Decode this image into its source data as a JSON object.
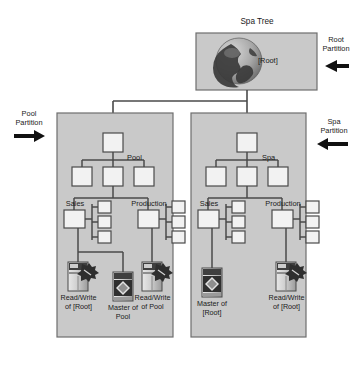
{
  "diagram": {
    "title": "Spa Tree",
    "background_color": "#ffffff",
    "partition_fill": "#c9c9c9",
    "partition_border": "#6e6e6e",
    "node_fill": "#f2f2f2",
    "node_border": "#4a4a4a",
    "line_color": "#4a4a4a",
    "text_color": "#1a1a1a"
  },
  "root_partition": {
    "label": "Spa Tree",
    "callout": "Root\nPartition",
    "callout_arrow": "arrow-left",
    "node_label": "[Root]",
    "icon": "globe-icon"
  },
  "pool_partition": {
    "callout": "Pool\nPartition",
    "callout_arrow": "arrow-right",
    "tree_label": "Pool",
    "branch_labels": [
      "Sales",
      "Production"
    ],
    "servers": [
      {
        "name": "server-read-write-root",
        "icon": "server-readwrite-icon",
        "label": "Read/Write\nof [Root]"
      },
      {
        "name": "server-master-pool",
        "icon": "server-master-icon",
        "label": "Master of\nPool"
      },
      {
        "name": "server-read-write-pool",
        "icon": "server-readwrite-icon",
        "label": "Read/Write\nof Pool"
      }
    ]
  },
  "spa_partition": {
    "callout": "Spa\nPartition",
    "callout_arrow": "arrow-left",
    "tree_label": "Spa",
    "branch_labels": [
      "Sales",
      "Production"
    ],
    "servers": [
      {
        "name": "server-master-root",
        "icon": "server-master-icon",
        "label": "Master of\n[Root]"
      },
      {
        "name": "server-read-write-root",
        "icon": "server-readwrite-icon",
        "label": "Read/Write\nof [Root]"
      }
    ]
  }
}
